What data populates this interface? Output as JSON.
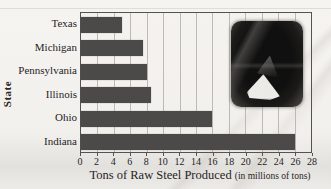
{
  "figure": {
    "kind": "scanned textbook bar chart",
    "background_paper": "#f2f0ed"
  },
  "chart_data": {
    "type": "bar",
    "orientation": "horizontal",
    "title": "",
    "categories": [
      "Texas",
      "Michigan",
      "Pennsylvania",
      "Illinois",
      "Ohio",
      "Indiana"
    ],
    "values": [
      5,
      7.5,
      8,
      8.5,
      16,
      26
    ],
    "xlabel_main": "Tons of Raw Steel Produced",
    "xlabel_unit": "(in millions of tons)",
    "xlabel": "Tons of Raw Steel Produced (in millions of tons)",
    "ylabel": "State",
    "xlim": [
      0,
      28
    ],
    "xticks": [
      0,
      2,
      4,
      6,
      8,
      10,
      12,
      14,
      16,
      18,
      20,
      22,
      24,
      26,
      28
    ],
    "grid": true,
    "legend": false,
    "bar_color": "#4b4a48",
    "inset_photo": "molten-steel-pour-photo"
  }
}
